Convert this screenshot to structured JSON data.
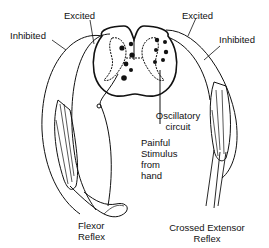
{
  "diagram": {
    "labels": {
      "excited_left": "Excited",
      "excited_right": "Excited",
      "inhibited_left": "Inhibited",
      "inhibited_right": "Inhibited",
      "oscillatory_1": "Oscillatory",
      "oscillatory_2": "circuit",
      "stimulus_1": "Painful",
      "stimulus_2": "Stimulus",
      "stimulus_3": "from",
      "stimulus_4": "hand",
      "flexor_1": "Flexor",
      "flexor_2": "Reflex",
      "crossed_1": "Crossed Extensor",
      "crossed_2": "Reflex"
    },
    "colors": {
      "ink": "#111111",
      "background": "#ffffff"
    }
  }
}
